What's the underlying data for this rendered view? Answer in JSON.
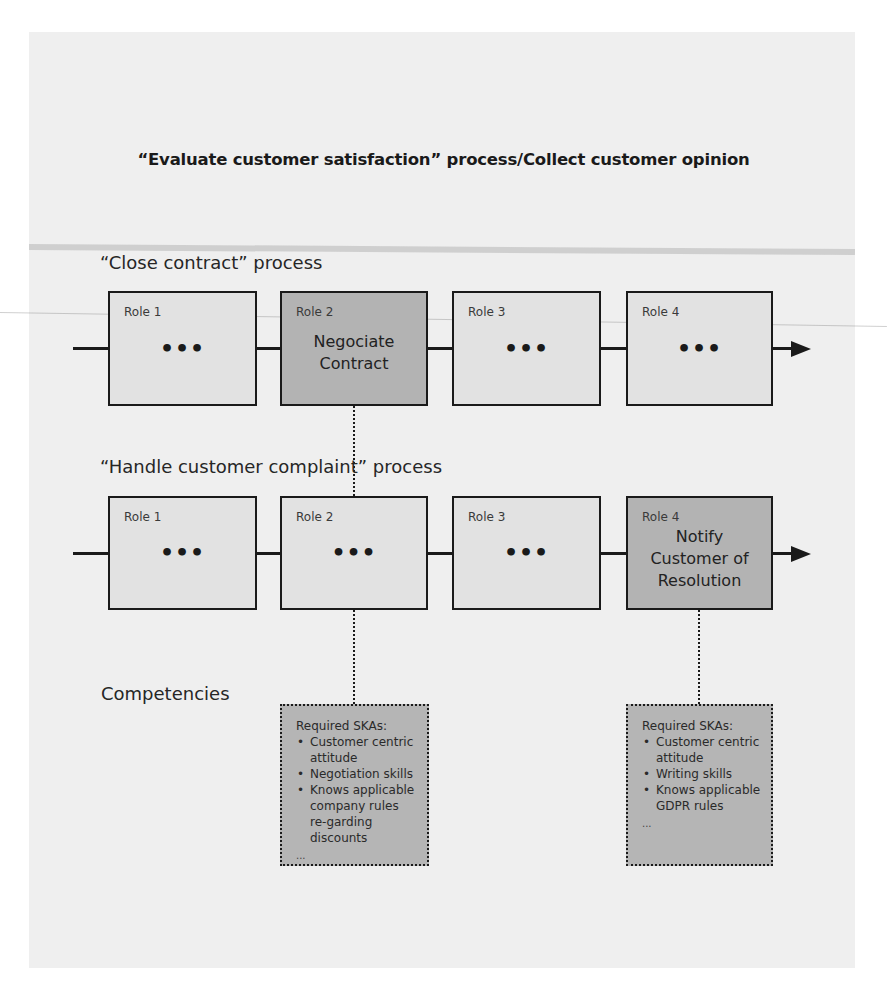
{
  "diagram": {
    "title": "“Evaluate customer satisfaction” process/Collect customer opinion",
    "processes": [
      {
        "title": "“Close contract” process",
        "roles": [
          {
            "label": "Role 1",
            "content": "•••",
            "highlighted": false
          },
          {
            "label": "Role 2",
            "content_lines": [
              "Negociate",
              "Contract"
            ],
            "highlighted": true
          },
          {
            "label": "Role 3",
            "content": "•••",
            "highlighted": false
          },
          {
            "label": "Role 4",
            "content": "•••",
            "highlighted": false
          }
        ]
      },
      {
        "title": "“Handle customer complaint” process",
        "roles": [
          {
            "label": "Role 1",
            "content": "•••",
            "highlighted": false
          },
          {
            "label": "Role 2",
            "content": "•••",
            "highlighted": false
          },
          {
            "label": "Role 3",
            "content": "•••",
            "highlighted": false
          },
          {
            "label": "Role 4",
            "content_lines": [
              "Notify",
              "Customer of",
              "Resolution"
            ],
            "highlighted": true
          }
        ]
      }
    ],
    "competencies": {
      "title": "Competencies",
      "boxes": [
        {
          "heading": "Required SKAs:",
          "items": [
            "Customer centric attitude",
            "Negotiation skills",
            "Knows applicable company rules re-garding discounts"
          ],
          "more": "..."
        },
        {
          "heading": "Required SKAs:",
          "items": [
            "Customer centric attitude",
            "Writing skills",
            "Knows applicable GDPR rules"
          ],
          "more": "..."
        }
      ]
    },
    "colors": {
      "panel": "#efefef",
      "box": "#e2e2e2",
      "box_highlight": "#b3b3b3",
      "ska_box": "#b5b5b5",
      "stroke": "#1a1a1a"
    }
  }
}
